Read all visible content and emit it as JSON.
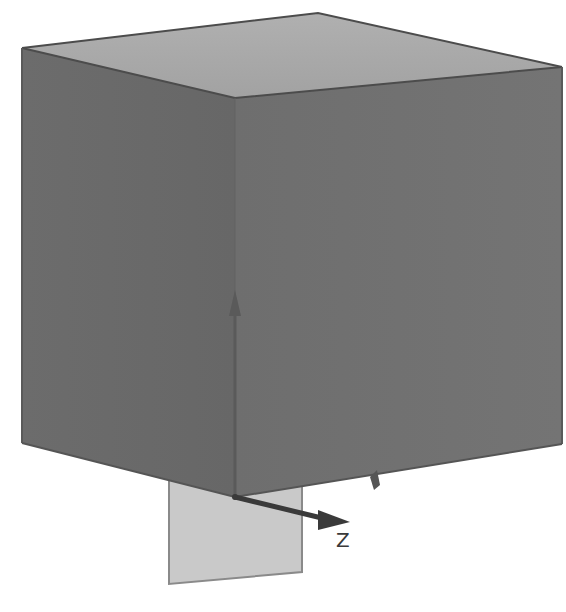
{
  "viewport": {
    "background": "#ffffff",
    "model": {
      "type": "cube",
      "top_face_color": "#a9a9a9",
      "left_face_color": "#6a6a6a",
      "right_face_color": "#707070",
      "edge_color": "#4a4a4a"
    },
    "plane": {
      "fill": "#c8c8c8",
      "edge": "#8a8a8a"
    },
    "triad": {
      "axes": [
        {
          "name": "Y",
          "label": "",
          "color": "#555555"
        },
        {
          "name": "Z",
          "label": "Z",
          "color": "#3a3a3a"
        },
        {
          "name": "X",
          "label": "",
          "color": "#555555"
        }
      ]
    }
  }
}
